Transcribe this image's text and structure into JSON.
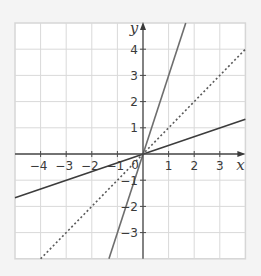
{
  "chart_data": {
    "type": "line",
    "title": "",
    "xlabel": "x",
    "ylabel": "y",
    "xlim": [
      -5,
      4
    ],
    "ylim": [
      -4,
      5
    ],
    "grid": true,
    "x_ticks": [
      -4,
      -3,
      -2,
      -1,
      1,
      2,
      3
    ],
    "y_ticks": [
      -3,
      -2,
      -1,
      1,
      2,
      3,
      4
    ],
    "x_tick_labels": [
      "−4",
      "−3",
      "−2",
      "−1",
      "1",
      "2",
      "3"
    ],
    "y_tick_labels": [
      "−3",
      "−2",
      "−1",
      "1",
      "2",
      "3",
      "4"
    ],
    "origin_label": "0",
    "series": [
      {
        "name": "steep solid line",
        "equation": "y = 3x",
        "style": "solid",
        "color": "#6e6e6e",
        "x": [
          -1.33,
          1.67
        ],
        "y": [
          -4,
          5
        ]
      },
      {
        "name": "dashed line",
        "equation": "y = x",
        "style": "dotted",
        "color": "#5a5a5a",
        "x": [
          -4,
          4
        ],
        "y": [
          -4,
          4
        ]
      },
      {
        "name": "shallow solid line",
        "equation": "y = x/3",
        "style": "solid",
        "color": "#3c3c3c",
        "x": [
          -5,
          4
        ],
        "y": [
          -1.67,
          1.33
        ]
      }
    ],
    "legend": null
  }
}
